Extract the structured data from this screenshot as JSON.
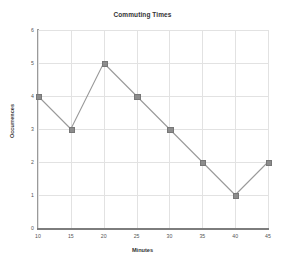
{
  "chart_data": {
    "type": "line",
    "title": "Commuting Times",
    "xlabel": "Minutes",
    "ylabel": "Occurrences",
    "x": [
      10,
      15,
      20,
      25,
      30,
      35,
      40,
      45
    ],
    "values": [
      4,
      3,
      5,
      4,
      3,
      2,
      1,
      2
    ],
    "series": [
      {
        "name": "Occurrences",
        "values": [
          4,
          3,
          5,
          4,
          3,
          2,
          1,
          2
        ]
      }
    ],
    "xticks": [
      "10",
      "15",
      "20",
      "25",
      "30",
      "35",
      "40",
      "45"
    ],
    "yticks": [
      "0",
      "1",
      "2",
      "3",
      "4",
      "5",
      "6"
    ],
    "xlim": [
      10,
      45
    ],
    "ylim": [
      0,
      6
    ],
    "grid": true,
    "legend": false,
    "marker": "square",
    "colors": {
      "line": "#9a9a9a",
      "marker": "#8c8c8c",
      "grid": "#e2e2e2",
      "axis": "#7d7d7d",
      "text": "#333333",
      "background": "#ffffff"
    }
  }
}
